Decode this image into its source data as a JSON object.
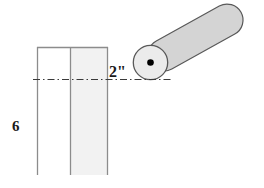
{
  "figure": {
    "background_color": "#ffffff",
    "width": 264,
    "height": 188,
    "labels": {
      "height_dimension": "6",
      "offset_dimension": "2\""
    },
    "parts": {
      "column": {
        "name": "vertical-column",
        "left_panel_fill": "#ffffff",
        "right_panel_fill": "#f2f2f2",
        "stroke_color": "#808080",
        "x_left": 37,
        "x_divider": 70,
        "x_right": 108,
        "y_top": 47,
        "y_bottom": 175,
        "bottom_open": true
      },
      "hub": {
        "name": "pivot-hub",
        "fill": "#ebebeb",
        "stroke_color": "#595959",
        "center_x": 150.5,
        "center_y": 62.5,
        "radius": 17.5
      },
      "pivot_point": {
        "name": "pivot-center-dot",
        "fill": "#000000",
        "center_x": 150.5,
        "center_y": 62.5,
        "radius": 3.2
      },
      "arm": {
        "name": "rotating-arm",
        "fill": "#d4d4d4",
        "stroke_color": "#595959",
        "tip_x": 249,
        "tip_y": 18,
        "base_x": 158,
        "base_y": 68,
        "half_width": 16,
        "angle_degrees": -29
      },
      "centerline": {
        "name": "horizontal-centerline",
        "style": "dash-dot",
        "stroke_color": "#333333",
        "y": 79.5,
        "x_start": 33,
        "x_end": 173
      }
    }
  }
}
